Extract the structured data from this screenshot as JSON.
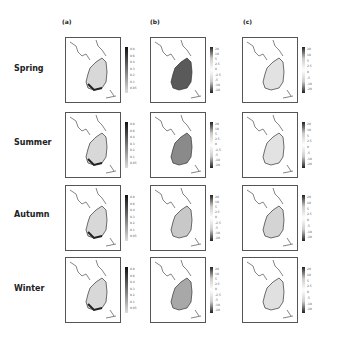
{
  "columns": [
    {
      "label": "(a)"
    },
    {
      "label": "(b)"
    },
    {
      "label": "(c)"
    }
  ],
  "rows": [
    {
      "label": "Spring"
    },
    {
      "label": "Summer"
    },
    {
      "label": "Autumn"
    },
    {
      "label": "Winter"
    }
  ],
  "colorbars": {
    "a": [
      "0.8",
      "0.6",
      "0.4",
      "0.3",
      "0.2",
      "0.1",
      "0.05"
    ],
    "b": [
      "20",
      "10",
      "5",
      "2.5",
      "0",
      "-2.5",
      "-5",
      "-10",
      "-20"
    ],
    "c": [
      "20",
      "10",
      "5",
      "2.5",
      "0",
      "-5",
      "-10",
      "-20"
    ]
  },
  "axes": {
    "y_ticks": [
      "40N",
      "39N",
      "38N",
      "37N",
      "36N",
      "35N",
      "34N",
      "33N"
    ],
    "x_ticks": [
      "124E",
      "126E",
      "128E",
      "130E"
    ]
  }
}
